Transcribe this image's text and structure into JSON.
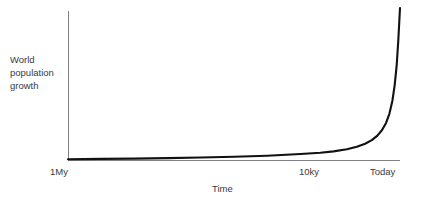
{
  "chart_data": {
    "type": "line",
    "title": "",
    "subtitle": "",
    "xlabel": "Time",
    "ylabel": "World population growth",
    "ylabel_lines": [
      "World",
      "population",
      "growth"
    ],
    "xtick_labels": [
      "1My",
      "10ky",
      "Today"
    ],
    "ytick_labels": [],
    "grid": false,
    "legend": null,
    "xlim": [
      0,
      1
    ],
    "ylim": [
      0,
      1
    ],
    "annotations": [],
    "series": [
      {
        "name": "World population growth",
        "color": "#111111",
        "x": [
          0.0,
          0.1,
          0.2,
          0.3,
          0.4,
          0.5,
          0.6,
          0.7,
          0.76,
          0.8,
          0.84,
          0.87,
          0.895,
          0.915,
          0.932,
          0.946,
          0.958,
          0.968,
          0.977,
          0.984,
          0.99,
          0.995,
          1.0
        ],
        "y": [
          0.0,
          0.002,
          0.004,
          0.007,
          0.011,
          0.016,
          0.023,
          0.034,
          0.043,
          0.052,
          0.066,
          0.082,
          0.102,
          0.126,
          0.156,
          0.193,
          0.24,
          0.3,
          0.385,
          0.49,
          0.62,
          0.79,
          1.0
        ]
      }
    ]
  },
  "axes": {
    "axis_color": "#808080",
    "curve_color": "#111111",
    "text_color": "#3a3a3a",
    "background": "#ffffff"
  }
}
